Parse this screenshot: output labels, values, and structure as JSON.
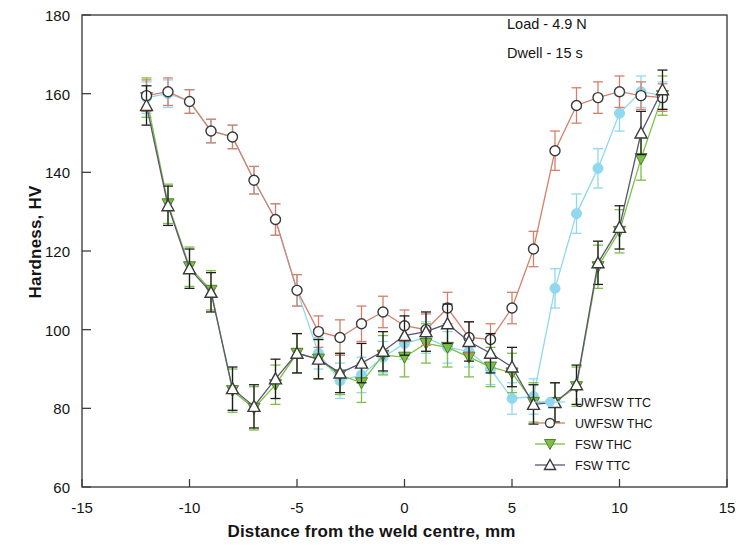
{
  "chart_data": {
    "type": "line",
    "title": "",
    "xlabel": "Distance from the weld centre, mm",
    "ylabel": "Hardness, HV",
    "xlim": [
      -15,
      15
    ],
    "ylim": [
      60,
      180
    ],
    "xticks": [
      -15,
      -10,
      -5,
      0,
      5,
      10,
      15
    ],
    "yticks": [
      60,
      80,
      100,
      120,
      140,
      160,
      180
    ],
    "grid": false,
    "legend_position": "bottom-right",
    "annotations": [
      "Load - 4.9 N",
      "Dwell - 15 s"
    ],
    "x": [
      -12,
      -11,
      -10,
      -9,
      -8,
      -7,
      -6,
      -5,
      -4,
      -3,
      -2,
      -1,
      0,
      1,
      2,
      3,
      4,
      5,
      6,
      7,
      8,
      9,
      10,
      11,
      12
    ],
    "series": [
      {
        "name": "UWFSW TTC",
        "color": "#8fd8f0",
        "marker": "filled-circle",
        "values": [
          159,
          160,
          158,
          150.5,
          149,
          138,
          128,
          110,
          94,
          87,
          88.5,
          93,
          96.5,
          98,
          95.5,
          94.5,
          90,
          82.5,
          83,
          110.5,
          129.5,
          141,
          155,
          160.5,
          159.5
        ],
        "errors": [
          4,
          3.5,
          3,
          3,
          3,
          3.5,
          4,
          4,
          4,
          4.5,
          4.5,
          4,
          4,
          4,
          4,
          4,
          4,
          4,
          4.5,
          5,
          5,
          5,
          4.5,
          4,
          3.5
        ]
      },
      {
        "name": "UWFSW THC",
        "color": "#d4806a",
        "marker": "open-circle",
        "values": [
          159.5,
          160.5,
          158,
          150.5,
          149,
          138,
          128,
          110,
          99.5,
          98,
          101.5,
          104.5,
          101,
          100,
          105.5,
          98,
          97.5,
          105.5,
          120.5,
          145.5,
          157,
          159,
          160.5,
          159.5,
          159
        ],
        "errors": [
          4,
          3.5,
          3,
          3,
          3,
          3.5,
          4,
          4,
          4,
          4.5,
          4.5,
          4,
          4,
          4,
          4,
          4,
          4,
          4,
          4.5,
          5,
          4.5,
          4,
          4,
          3.5,
          3.5
        ]
      },
      {
        "name": "FSW THC",
        "color": "#7bc043",
        "marker": "filled-down-triangle",
        "values": [
          159,
          132,
          116,
          110,
          84.5,
          80,
          86,
          94,
          92.5,
          88.5,
          86.5,
          93.5,
          93,
          96.5,
          95.5,
          93,
          90.5,
          89,
          81.5,
          81.5,
          85.5,
          116,
          125,
          143.5,
          159.5
        ],
        "errors": [
          5,
          5,
          5,
          5,
          5.5,
          5.5,
          5,
          5,
          5,
          5,
          5,
          5,
          5,
          5,
          5,
          5,
          5,
          5,
          5,
          5,
          5,
          5.5,
          5.5,
          5.5,
          5
        ]
      },
      {
        "name": "FSW TTC",
        "color": "#5b5474",
        "marker": "open-up-triangle",
        "values": [
          157,
          131.5,
          115.5,
          109.5,
          85,
          80.5,
          87.5,
          94,
          92.5,
          89,
          91.5,
          94.5,
          98.5,
          99.5,
          101.5,
          97,
          94,
          90.5,
          81,
          81.5,
          86,
          117,
          126,
          150,
          161
        ],
        "errors": [
          5,
          5,
          5,
          5,
          5.5,
          5.5,
          5,
          5,
          5,
          5,
          5,
          5,
          5,
          5,
          5,
          5,
          5,
          5,
          5,
          5,
          5,
          5.5,
          5.5,
          5.5,
          5
        ]
      }
    ]
  },
  "annotation_block": {
    "line1": "Load - 4.9 N",
    "line2": "Dwell - 15 s"
  },
  "axes": {
    "x_title": "Distance from the weld centre, mm",
    "y_title": "Hardness, HV",
    "x_tick_labels": [
      "-15",
      "-10",
      "-5",
      "0",
      "5",
      "10",
      "15"
    ],
    "y_tick_labels": [
      "60",
      "80",
      "100",
      "120",
      "140",
      "160",
      "180"
    ]
  },
  "legend": {
    "entries": [
      {
        "label": "UWFSW TTC",
        "color": "#8fd8f0",
        "marker": "filled-circle"
      },
      {
        "label": "UWFSW THC",
        "color": "#d4806a",
        "marker": "open-circle"
      },
      {
        "label": "FSW THC",
        "color": "#7bc043",
        "marker": "filled-down-triangle"
      },
      {
        "label": "FSW TTC",
        "color": "#5b5474",
        "marker": "open-up-triangle"
      }
    ]
  }
}
